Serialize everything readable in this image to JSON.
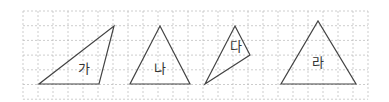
{
  "grid": {
    "x0": 23,
    "y0": 11,
    "cell_w": 15,
    "cell_h": 14.7,
    "cols": 23,
    "rows": 6,
    "line_color": "#b8b8b8",
    "dash": "2,2"
  },
  "shape_style": {
    "stroke": "#444444",
    "stroke_width": 1.2
  },
  "triangles": [
    {
      "label": "가",
      "points": [
        [
          39,
          84
        ],
        [
          99,
          84
        ],
        [
          114,
          26
        ]
      ],
      "label_pos": [
        84,
        73
      ]
    },
    {
      "label": "나",
      "points": [
        [
          130,
          84
        ],
        [
          190,
          84
        ],
        [
          160,
          26
        ]
      ],
      "label_pos": [
        160,
        73
      ]
    },
    {
      "label": "다",
      "points": [
        [
          235,
          26
        ],
        [
          250,
          55
        ],
        [
          205,
          84
        ]
      ],
      "label_pos": [
        236,
        51
      ]
    },
    {
      "label": "라",
      "points": [
        [
          281,
          84
        ],
        [
          356,
          84
        ],
        [
          318,
          21
        ]
      ],
      "label_pos": [
        318,
        67
      ]
    }
  ]
}
